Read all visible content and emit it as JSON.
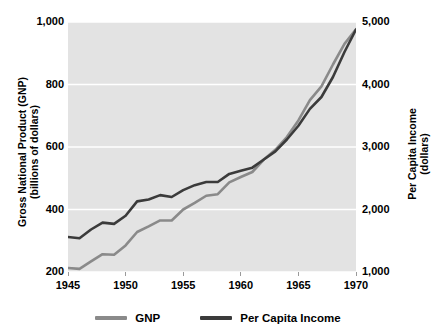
{
  "chart_data": {
    "type": "line",
    "title": "",
    "xlabel": "",
    "ylabel": "Gross National Product (GNP)\n(billions of dollars)",
    "y2label": "Per Capita Income\n(dollars)",
    "xlim": [
      1945,
      1970
    ],
    "ylim": [
      200,
      1000
    ],
    "y2lim": [
      1000,
      5000
    ],
    "grid": true,
    "grid_color": "#ffffff",
    "plot_background": "#e3e3e3",
    "legend_position": "bottom",
    "xticks": [
      1945,
      1950,
      1955,
      1960,
      1965,
      1970
    ],
    "xticklabels": [
      "1945",
      "1950",
      "1955",
      "1960",
      "1965",
      "1970"
    ],
    "yticks": [
      200,
      400,
      600,
      800,
      1000
    ],
    "yticklabels": [
      "200",
      "400",
      "600",
      "800",
      "1,000"
    ],
    "y2ticks": [
      1000,
      2000,
      3000,
      4000,
      5000
    ],
    "y2ticklabels": [
      "1,000",
      "2,000",
      "3,000",
      "4,000",
      "5,000"
    ],
    "x": [
      1945,
      1946,
      1947,
      1948,
      1949,
      1950,
      1951,
      1952,
      1953,
      1954,
      1955,
      1956,
      1957,
      1958,
      1959,
      1960,
      1961,
      1962,
      1963,
      1964,
      1965,
      1966,
      1967,
      1968,
      1969,
      1970
    ],
    "series": [
      {
        "name": "GNP",
        "axis": "left",
        "color": "#8a8a8a",
        "units": "billions of dollars",
        "values": [
          213,
          210,
          234,
          257,
          255,
          285,
          328,
          346,
          365,
          365,
          400,
          421,
          444,
          449,
          487,
          504,
          520,
          560,
          591,
          632,
          685,
          750,
          794,
          864,
          930,
          977
        ]
      },
      {
        "name": "Per Capita Income",
        "axis": "right",
        "color": "#3b3b3b",
        "units": "dollars",
        "values": [
          1560,
          1540,
          1680,
          1790,
          1770,
          1900,
          2130,
          2160,
          2230,
          2200,
          2310,
          2390,
          2440,
          2440,
          2570,
          2620,
          2670,
          2800,
          2930,
          3120,
          3340,
          3610,
          3800,
          4120,
          4520,
          4880
        ]
      }
    ]
  },
  "legend": {
    "items": [
      {
        "label": "GNP",
        "color": "#8a8a8a"
      },
      {
        "label": "Per Capita Income",
        "color": "#3b3b3b"
      }
    ]
  },
  "axes": {
    "left_title": "Gross National Product (GNP)\n(billions of dollars)",
    "right_title": "Per Capita Income\n(dollars)"
  }
}
